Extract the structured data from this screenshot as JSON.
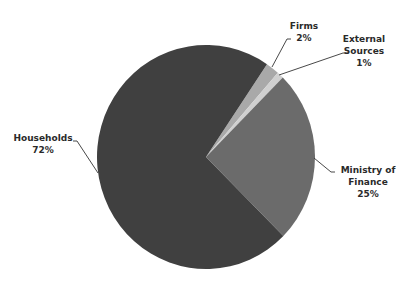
{
  "chart_data": {
    "type": "pie",
    "title": "",
    "categories": [
      "Firms",
      "External Sources",
      "Ministry of Finance",
      "Households"
    ],
    "values": [
      2,
      1,
      25,
      72
    ],
    "unit": "%",
    "colors": [
      "#a9a9a9",
      "#d0d0d0",
      "#6b6b6b",
      "#404040"
    ],
    "start_angle_deg": 34,
    "direction": "clockwise",
    "legend": "none",
    "labels": [
      {
        "name_lines": [
          "Firms"
        ],
        "pct": "2%"
      },
      {
        "name_lines": [
          "External",
          "Sources"
        ],
        "pct": "1%"
      },
      {
        "name_lines": [
          "Ministry of",
          "Finance"
        ],
        "pct": "25%"
      },
      {
        "name_lines": [
          "Households"
        ],
        "pct": "72%"
      }
    ]
  },
  "labels": {
    "firms": {
      "line1": "Firms",
      "pct": "2%"
    },
    "external": {
      "line1": "External",
      "line2": "Sources",
      "pct": "1%"
    },
    "ministry": {
      "line1": "Ministry of",
      "line2": "Finance",
      "pct": "25%"
    },
    "households": {
      "line1": "Households",
      "pct": "72%"
    }
  }
}
